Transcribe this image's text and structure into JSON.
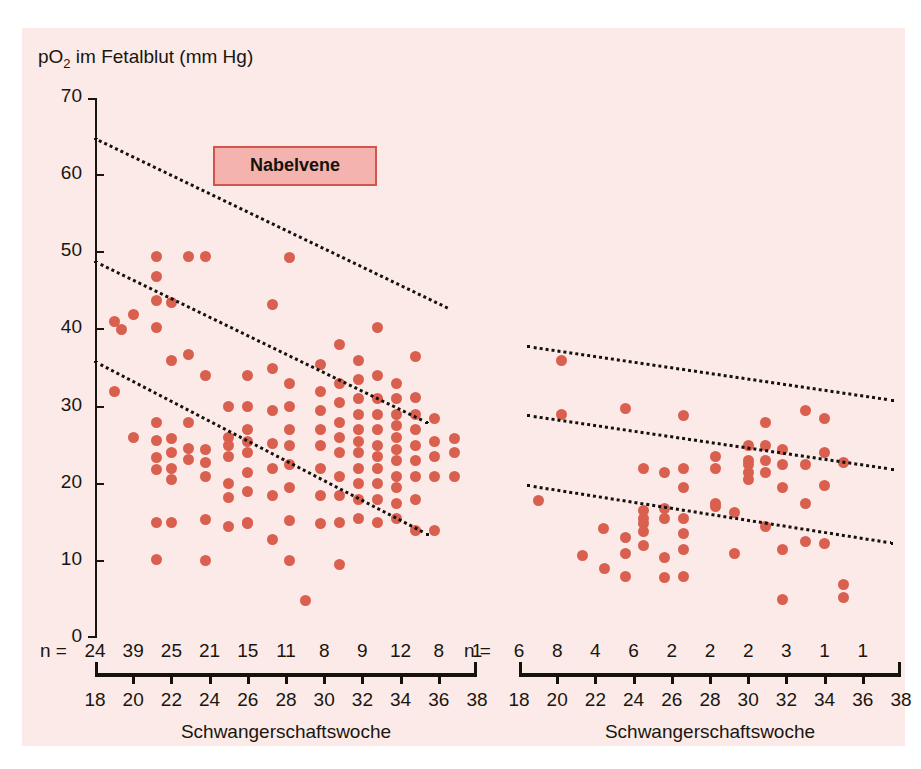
{
  "figure": {
    "background_color": "#fbeae8",
    "axis_title_y": "pO2 im Fetalblut (mm Hg)",
    "axis_title_y_prefix": "pO",
    "axis_title_y_sub": "2",
    "axis_title_y_suffix": " im Fetalblut (mm Hg)",
    "dot_color": "#d9604f",
    "line_color": "#15120c",
    "legend_box_fill": "#f4b3ae",
    "legend_box_border": "#d2554c"
  },
  "panels": {
    "left": {
      "legend_label": "Nabelvene",
      "x_axis_title": "Schwangerschaftswoche",
      "n_prefix": "n ="
    },
    "right": {
      "legend_label": "Nabelarterie",
      "x_axis_title": "Schwangerschaftswoche",
      "n_prefix": "n ="
    }
  },
  "chart_data": [
    {
      "type": "scatter",
      "title": "Nabelvene",
      "xlabel": "Schwangerschaftswoche",
      "ylabel": "pO2 im Fetalblut (mm Hg)",
      "xlim": [
        18,
        38
      ],
      "ylim": [
        0,
        70
      ],
      "yticks": [
        0,
        10,
        20,
        30,
        40,
        50,
        60,
        70
      ],
      "xticks": [
        18,
        20,
        22,
        24,
        26,
        28,
        30,
        32,
        34,
        36,
        38
      ],
      "grid": false,
      "legend_position": "top-center",
      "n_label": "n =",
      "n_values": [
        24,
        39,
        25,
        21,
        15,
        11,
        8,
        9,
        12,
        8,
        1
      ],
      "points": [
        {
          "x": 19.0,
          "y": 41.0
        },
        {
          "x": 19.0,
          "y": 32.0
        },
        {
          "x": 19.4,
          "y": 40.0
        },
        {
          "x": 20.0,
          "y": 42.0
        },
        {
          "x": 20.0,
          "y": 26.0
        },
        {
          "x": 21.2,
          "y": 49.5
        },
        {
          "x": 21.2,
          "y": 46.8
        },
        {
          "x": 21.2,
          "y": 43.8
        },
        {
          "x": 21.2,
          "y": 40.3
        },
        {
          "x": 21.2,
          "y": 28.0
        },
        {
          "x": 21.2,
          "y": 25.6
        },
        {
          "x": 21.2,
          "y": 23.4
        },
        {
          "x": 21.2,
          "y": 21.8
        },
        {
          "x": 21.2,
          "y": 15.0
        },
        {
          "x": 21.2,
          "y": 10.2
        },
        {
          "x": 22.0,
          "y": 43.5
        },
        {
          "x": 22.0,
          "y": 36.0
        },
        {
          "x": 22.0,
          "y": 25.8
        },
        {
          "x": 22.0,
          "y": 24.0
        },
        {
          "x": 22.0,
          "y": 22.0
        },
        {
          "x": 22.0,
          "y": 20.5
        },
        {
          "x": 22.0,
          "y": 15.0
        },
        {
          "x": 22.9,
          "y": 49.5
        },
        {
          "x": 22.9,
          "y": 36.8
        },
        {
          "x": 22.9,
          "y": 28.0
        },
        {
          "x": 22.9,
          "y": 24.6
        },
        {
          "x": 22.9,
          "y": 23.2
        },
        {
          "x": 23.8,
          "y": 49.5
        },
        {
          "x": 23.8,
          "y": 34.0
        },
        {
          "x": 23.8,
          "y": 24.5
        },
        {
          "x": 23.8,
          "y": 22.8
        },
        {
          "x": 23.8,
          "y": 21.0
        },
        {
          "x": 23.8,
          "y": 15.4
        },
        {
          "x": 23.8,
          "y": 10.0
        },
        {
          "x": 25.0,
          "y": 30.0
        },
        {
          "x": 25.0,
          "y": 26.0
        },
        {
          "x": 25.0,
          "y": 25.0
        },
        {
          "x": 25.0,
          "y": 23.5
        },
        {
          "x": 25.0,
          "y": 20.0
        },
        {
          "x": 25.0,
          "y": 18.2
        },
        {
          "x": 25.0,
          "y": 14.5
        },
        {
          "x": 26.0,
          "y": 34.0
        },
        {
          "x": 26.0,
          "y": 30.0
        },
        {
          "x": 26.0,
          "y": 27.0
        },
        {
          "x": 26.0,
          "y": 25.5
        },
        {
          "x": 26.0,
          "y": 24.0
        },
        {
          "x": 26.0,
          "y": 21.5
        },
        {
          "x": 26.0,
          "y": 19.0
        },
        {
          "x": 26.0,
          "y": 15.0
        },
        {
          "x": 26.0,
          "y": 14.8
        },
        {
          "x": 27.3,
          "y": 43.2
        },
        {
          "x": 27.3,
          "y": 35.0
        },
        {
          "x": 27.3,
          "y": 29.5
        },
        {
          "x": 27.3,
          "y": 25.2
        },
        {
          "x": 27.3,
          "y": 22.0
        },
        {
          "x": 27.3,
          "y": 18.5
        },
        {
          "x": 27.3,
          "y": 12.8
        },
        {
          "x": 28.2,
          "y": 49.3
        },
        {
          "x": 28.2,
          "y": 33.0
        },
        {
          "x": 28.2,
          "y": 30.0
        },
        {
          "x": 28.2,
          "y": 27.0
        },
        {
          "x": 28.2,
          "y": 25.0
        },
        {
          "x": 28.2,
          "y": 22.5
        },
        {
          "x": 28.2,
          "y": 19.5
        },
        {
          "x": 28.2,
          "y": 15.2
        },
        {
          "x": 28.2,
          "y": 10.0
        },
        {
          "x": 29.0,
          "y": 4.8
        },
        {
          "x": 29.8,
          "y": 35.5
        },
        {
          "x": 29.8,
          "y": 32.0
        },
        {
          "x": 29.8,
          "y": 29.5
        },
        {
          "x": 29.8,
          "y": 27.0
        },
        {
          "x": 29.8,
          "y": 25.0
        },
        {
          "x": 29.8,
          "y": 22.0
        },
        {
          "x": 29.8,
          "y": 18.5
        },
        {
          "x": 29.8,
          "y": 14.8
        },
        {
          "x": 30.8,
          "y": 38.0
        },
        {
          "x": 30.8,
          "y": 33.0
        },
        {
          "x": 30.8,
          "y": 30.5
        },
        {
          "x": 30.8,
          "y": 28.0
        },
        {
          "x": 30.8,
          "y": 26.0
        },
        {
          "x": 30.8,
          "y": 24.0
        },
        {
          "x": 30.8,
          "y": 21.0
        },
        {
          "x": 30.8,
          "y": 18.5
        },
        {
          "x": 30.8,
          "y": 15.0
        },
        {
          "x": 30.8,
          "y": 9.5
        },
        {
          "x": 31.8,
          "y": 36.0
        },
        {
          "x": 31.8,
          "y": 33.5
        },
        {
          "x": 31.8,
          "y": 31.0
        },
        {
          "x": 31.8,
          "y": 29.0
        },
        {
          "x": 31.8,
          "y": 27.0
        },
        {
          "x": 31.8,
          "y": 25.5
        },
        {
          "x": 31.8,
          "y": 24.0
        },
        {
          "x": 31.8,
          "y": 22.0
        },
        {
          "x": 31.8,
          "y": 20.0
        },
        {
          "x": 31.8,
          "y": 18.0
        },
        {
          "x": 31.8,
          "y": 15.5
        },
        {
          "x": 32.8,
          "y": 40.3
        },
        {
          "x": 32.8,
          "y": 34.0
        },
        {
          "x": 32.8,
          "y": 31.0
        },
        {
          "x": 32.8,
          "y": 29.0
        },
        {
          "x": 32.8,
          "y": 27.0
        },
        {
          "x": 32.8,
          "y": 25.0
        },
        {
          "x": 32.8,
          "y": 23.5
        },
        {
          "x": 32.8,
          "y": 22.0
        },
        {
          "x": 32.8,
          "y": 20.0
        },
        {
          "x": 32.8,
          "y": 18.0
        },
        {
          "x": 32.8,
          "y": 15.0
        },
        {
          "x": 33.8,
          "y": 33.0
        },
        {
          "x": 33.8,
          "y": 31.0
        },
        {
          "x": 33.8,
          "y": 29.0
        },
        {
          "x": 33.8,
          "y": 27.5
        },
        {
          "x": 33.8,
          "y": 26.0
        },
        {
          "x": 33.8,
          "y": 24.5
        },
        {
          "x": 33.8,
          "y": 23.0
        },
        {
          "x": 33.8,
          "y": 21.0
        },
        {
          "x": 33.8,
          "y": 19.5
        },
        {
          "x": 33.8,
          "y": 17.5
        },
        {
          "x": 33.8,
          "y": 15.5
        },
        {
          "x": 34.8,
          "y": 36.5
        },
        {
          "x": 34.8,
          "y": 31.2
        },
        {
          "x": 34.8,
          "y": 29.0
        },
        {
          "x": 34.8,
          "y": 27.0
        },
        {
          "x": 34.8,
          "y": 25.0
        },
        {
          "x": 34.8,
          "y": 23.0
        },
        {
          "x": 34.8,
          "y": 21.0
        },
        {
          "x": 34.8,
          "y": 18.0
        },
        {
          "x": 34.8,
          "y": 14.0
        },
        {
          "x": 35.8,
          "y": 28.5
        },
        {
          "x": 35.8,
          "y": 25.5
        },
        {
          "x": 35.8,
          "y": 23.5
        },
        {
          "x": 35.8,
          "y": 21.0
        },
        {
          "x": 35.8,
          "y": 14.0
        },
        {
          "x": 36.8,
          "y": 25.8
        },
        {
          "x": 36.8,
          "y": 24.0
        },
        {
          "x": 36.8,
          "y": 21.0
        }
      ],
      "reference_lines": [
        {
          "name": "upper",
          "x0": 18.0,
          "y0": 65.0,
          "x1": 36.5,
          "y1": 43.0
        },
        {
          "name": "middle",
          "x0": 18.0,
          "y0": 49.0,
          "x1": 35.5,
          "y1": 28.0
        },
        {
          "name": "lower",
          "x0": 18.0,
          "y0": 36.0,
          "x1": 35.5,
          "y1": 13.5
        }
      ]
    },
    {
      "type": "scatter",
      "title": "Nabelarterie",
      "xlabel": "Schwangerschaftswoche",
      "ylabel": "pO2 im Fetalblut (mm Hg)",
      "xlim": [
        18,
        38
      ],
      "ylim": [
        0,
        70
      ],
      "yticks": [
        0,
        10,
        20,
        30,
        40,
        50,
        60,
        70
      ],
      "xticks": [
        18,
        20,
        22,
        24,
        26,
        28,
        30,
        32,
        34,
        36,
        38
      ],
      "grid": false,
      "legend_position": "top-center",
      "n_label": "n =",
      "n_values": [
        6,
        8,
        4,
        6,
        2,
        2,
        2,
        3,
        1,
        1
      ],
      "points": [
        {
          "x": 19.0,
          "y": 17.8
        },
        {
          "x": 20.2,
          "y": 36.0
        },
        {
          "x": 20.2,
          "y": 29.0
        },
        {
          "x": 21.3,
          "y": 10.7
        },
        {
          "x": 22.4,
          "y": 14.2
        },
        {
          "x": 22.5,
          "y": 9.0
        },
        {
          "x": 23.6,
          "y": 29.7
        },
        {
          "x": 23.6,
          "y": 13.0
        },
        {
          "x": 23.6,
          "y": 11.0
        },
        {
          "x": 23.6,
          "y": 8.0
        },
        {
          "x": 24.5,
          "y": 22.0
        },
        {
          "x": 24.5,
          "y": 16.5
        },
        {
          "x": 24.5,
          "y": 15.5
        },
        {
          "x": 24.5,
          "y": 14.8
        },
        {
          "x": 24.5,
          "y": 13.8
        },
        {
          "x": 24.5,
          "y": 12.0
        },
        {
          "x": 25.6,
          "y": 21.5
        },
        {
          "x": 25.6,
          "y": 16.8
        },
        {
          "x": 25.6,
          "y": 15.5
        },
        {
          "x": 25.6,
          "y": 10.5
        },
        {
          "x": 25.6,
          "y": 7.8
        },
        {
          "x": 26.6,
          "y": 28.8
        },
        {
          "x": 26.6,
          "y": 22.0
        },
        {
          "x": 26.6,
          "y": 19.5
        },
        {
          "x": 26.6,
          "y": 15.5
        },
        {
          "x": 26.6,
          "y": 13.5
        },
        {
          "x": 26.6,
          "y": 11.5
        },
        {
          "x": 26.6,
          "y": 8.0
        },
        {
          "x": 28.3,
          "y": 23.5
        },
        {
          "x": 28.3,
          "y": 22.0
        },
        {
          "x": 28.3,
          "y": 17.5
        },
        {
          "x": 28.3,
          "y": 17.0
        },
        {
          "x": 29.3,
          "y": 16.3
        },
        {
          "x": 29.3,
          "y": 11.0
        },
        {
          "x": 30.0,
          "y": 25.0
        },
        {
          "x": 30.0,
          "y": 23.0
        },
        {
          "x": 30.0,
          "y": 22.5
        },
        {
          "x": 30.0,
          "y": 21.5
        },
        {
          "x": 30.0,
          "y": 20.5
        },
        {
          "x": 30.9,
          "y": 28.0
        },
        {
          "x": 30.9,
          "y": 25.0
        },
        {
          "x": 30.9,
          "y": 23.0
        },
        {
          "x": 30.9,
          "y": 21.5
        },
        {
          "x": 30.9,
          "y": 14.5
        },
        {
          "x": 31.8,
          "y": 24.5
        },
        {
          "x": 31.8,
          "y": 22.5
        },
        {
          "x": 31.8,
          "y": 19.5
        },
        {
          "x": 31.8,
          "y": 11.5
        },
        {
          "x": 31.8,
          "y": 5.0
        },
        {
          "x": 33.0,
          "y": 29.5
        },
        {
          "x": 33.0,
          "y": 22.5
        },
        {
          "x": 33.0,
          "y": 17.5
        },
        {
          "x": 33.0,
          "y": 12.5
        },
        {
          "x": 34.0,
          "y": 28.5
        },
        {
          "x": 34.0,
          "y": 24.0
        },
        {
          "x": 34.0,
          "y": 19.8
        },
        {
          "x": 34.0,
          "y": 12.3
        },
        {
          "x": 35.0,
          "y": 22.8
        },
        {
          "x": 35.0,
          "y": 7.0
        },
        {
          "x": 35.0,
          "y": 5.3
        }
      ],
      "reference_lines": [
        {
          "name": "upper",
          "x0": 18.4,
          "y0": 38.0,
          "x1": 37.6,
          "y1": 31.0
        },
        {
          "name": "middle",
          "x0": 18.4,
          "y0": 29.0,
          "x1": 37.6,
          "y1": 22.0
        },
        {
          "name": "lower",
          "x0": 18.4,
          "y0": 20.0,
          "x1": 37.6,
          "y1": 12.5
        }
      ]
    }
  ]
}
